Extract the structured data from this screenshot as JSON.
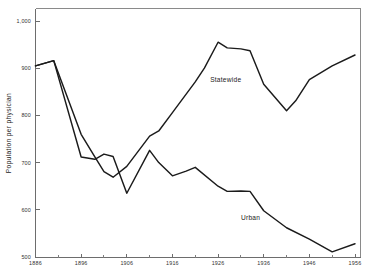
{
  "chart_data": {
    "type": "line",
    "title": "",
    "subtitle": "",
    "xlabel": "",
    "ylabel": "Population per physician",
    "xlim": [
      1886,
      1956
    ],
    "ylim": [
      500,
      1000
    ],
    "grid": false,
    "legend_position": "inline-labels",
    "x_ticks_major": [
      1886,
      1896,
      1906,
      1916,
      1926,
      1936,
      1946,
      1956
    ],
    "x_tick_labels": [
      "1886",
      "1896",
      "1906",
      "1916",
      "1926",
      "1936",
      "1946",
      "1956"
    ],
    "x_ticks_minor": [
      1891,
      1901,
      1911,
      1921,
      1931,
      1941,
      1951
    ],
    "y_ticks_major": [
      500,
      600,
      700,
      800,
      900,
      1000
    ],
    "y_tick_labels": [
      "500",
      "600",
      "700",
      "800",
      "900",
      "1,000"
    ],
    "series": [
      {
        "name": "Statewide",
        "label": "Statewide",
        "color": "#1b1b1b",
        "points": [
          {
            "x": 1886,
            "y": 905
          },
          {
            "x": 1890,
            "y": 916
          },
          {
            "x": 1896,
            "y": 760
          },
          {
            "x": 1899,
            "y": 712
          },
          {
            "x": 1901,
            "y": 681
          },
          {
            "x": 1903,
            "y": 669
          },
          {
            "x": 1906,
            "y": 692
          },
          {
            "x": 1911,
            "y": 756
          },
          {
            "x": 1913,
            "y": 767
          },
          {
            "x": 1916,
            "y": 806
          },
          {
            "x": 1921,
            "y": 871
          },
          {
            "x": 1923,
            "y": 900
          },
          {
            "x": 1926,
            "y": 955
          },
          {
            "x": 1928,
            "y": 943
          },
          {
            "x": 1931,
            "y": 941
          },
          {
            "x": 1933,
            "y": 937
          },
          {
            "x": 1936,
            "y": 866
          },
          {
            "x": 1941,
            "y": 810
          },
          {
            "x": 1943,
            "y": 831
          },
          {
            "x": 1946,
            "y": 876
          },
          {
            "x": 1951,
            "y": 905
          },
          {
            "x": 1956,
            "y": 928
          }
        ]
      },
      {
        "name": "Urban",
        "label": "Urban",
        "color": "#1b1b1b",
        "points": [
          {
            "x": 1886,
            "y": 905
          },
          {
            "x": 1890,
            "y": 916
          },
          {
            "x": 1896,
            "y": 712
          },
          {
            "x": 1899,
            "y": 707
          },
          {
            "x": 1901,
            "y": 718
          },
          {
            "x": 1903,
            "y": 713
          },
          {
            "x": 1906,
            "y": 635
          },
          {
            "x": 1911,
            "y": 726
          },
          {
            "x": 1913,
            "y": 700
          },
          {
            "x": 1916,
            "y": 672
          },
          {
            "x": 1919,
            "y": 682
          },
          {
            "x": 1921,
            "y": 690
          },
          {
            "x": 1926,
            "y": 650
          },
          {
            "x": 1928,
            "y": 639
          },
          {
            "x": 1931,
            "y": 640
          },
          {
            "x": 1933,
            "y": 639
          },
          {
            "x": 1936,
            "y": 598
          },
          {
            "x": 1941,
            "y": 562
          },
          {
            "x": 1946,
            "y": 538
          },
          {
            "x": 1951,
            "y": 511
          },
          {
            "x": 1956,
            "y": 528
          }
        ]
      }
    ],
    "annotations": [
      {
        "text": "Statewide",
        "x": 1929,
        "y": 905,
        "dx": -6,
        "dy": 16
      },
      {
        "text": "Urban",
        "x": 1934,
        "y": 608,
        "dx": -4,
        "dy": 14
      }
    ]
  }
}
